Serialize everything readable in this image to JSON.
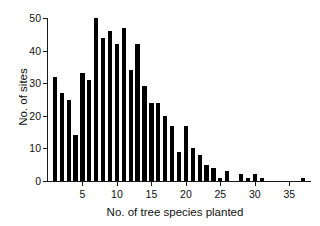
{
  "chart_data": {
    "type": "bar",
    "title": "",
    "xlabel": "No. of tree species planted",
    "ylabel": "No. of sites",
    "xlim": [
      0,
      38
    ],
    "ylim": [
      0,
      50
    ],
    "grid": false,
    "legend": null,
    "xticks": [
      5,
      10,
      15,
      20,
      25,
      30,
      35
    ],
    "yticks": [
      0,
      10,
      20,
      30,
      40,
      50
    ],
    "categories": [
      1,
      2,
      3,
      4,
      5,
      6,
      7,
      8,
      9,
      10,
      11,
      12,
      13,
      14,
      15,
      16,
      17,
      18,
      19,
      20,
      21,
      22,
      23,
      24,
      25,
      26,
      27,
      28,
      29,
      30,
      31,
      32,
      33,
      34,
      35,
      36,
      37
    ],
    "values": [
      32,
      27,
      25,
      14,
      33,
      31,
      50,
      44,
      46,
      42,
      47,
      34,
      42,
      29,
      24,
      24,
      20,
      17,
      9,
      17,
      10,
      8,
      5,
      4,
      1,
      3,
      0,
      2,
      1,
      2,
      1,
      0,
      0,
      0,
      0,
      0,
      1
    ]
  },
  "axes": {
    "ylabel": "No. of sites",
    "xlabel": "No. of tree species planted",
    "ytick_labels": [
      "0",
      "10",
      "20",
      "30",
      "40",
      "50"
    ],
    "xtick_labels": [
      "5",
      "10",
      "15",
      "20",
      "25",
      "30",
      "35"
    ]
  },
  "colors": {
    "bar": "#000000",
    "axis": "#1a1a1a",
    "background": "#ffffff"
  }
}
